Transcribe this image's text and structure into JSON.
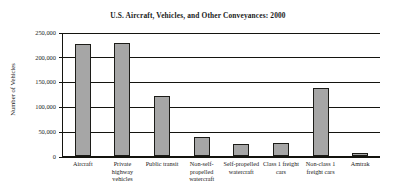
{
  "chart_data": {
    "type": "bar",
    "title": "U.S. Aircraft, Vehicles, and Other Conveyances: 2000",
    "xlabel": "",
    "ylabel": "Number of Vehicles",
    "categories": [
      "Aircraft",
      "Private highway vehicles",
      "Public transit",
      "Non-self-propelled watercraft",
      "Self-propelled watercraft",
      "Class 1 freight cars",
      "Non-class 1 freight cars",
      "Amtrak"
    ],
    "values": [
      226000,
      227000,
      121000,
      38000,
      25000,
      26000,
      137000,
      6000
    ],
    "ylim": [
      0,
      250000
    ],
    "ytick_labels": [
      "250,000",
      "200,000",
      "150,000",
      "100,000",
      "50,000",
      "0"
    ],
    "ytick_values": [
      250000,
      200000,
      150000,
      100000,
      50000,
      0
    ],
    "grid": true,
    "legend": false,
    "bar_color": "#a6a6a6",
    "bar_border_color": "#1c1c18",
    "axis_color": "#14140f"
  }
}
